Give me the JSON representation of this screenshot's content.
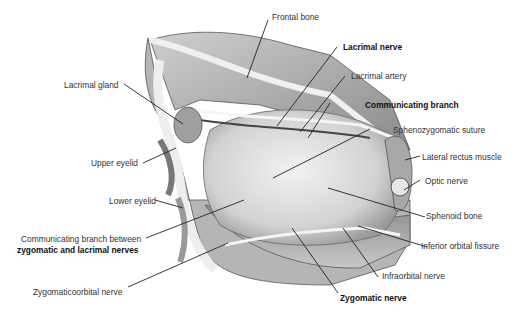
{
  "figure": {
    "type": "anatomical illustration",
    "labels": [
      {
        "id": "frontal-bone",
        "text": "Frontal bone",
        "bold": false
      },
      {
        "id": "lacrimal-nerve",
        "text": "Lacrimal nerve",
        "bold": true
      },
      {
        "id": "lacrimal-artery",
        "text": "Lacrimal artery",
        "bold": false
      },
      {
        "id": "communicating-branch",
        "text": "Communicating branch",
        "bold": true
      },
      {
        "id": "sphenozygomatic-suture",
        "text": "Sphenozygomatic suture",
        "bold": false
      },
      {
        "id": "lateral-rectus-muscle",
        "text": "Lateral rectus muscle",
        "bold": false
      },
      {
        "id": "optic-nerve",
        "text": "Optic nerve",
        "bold": false
      },
      {
        "id": "sphenoid-bone",
        "text": "Sphenoid bone",
        "bold": false
      },
      {
        "id": "inferior-orbital-fissure",
        "text": "Inferior orbital fissure",
        "bold": false
      },
      {
        "id": "infraorbital-nerve",
        "text": "Infraorbital nerve",
        "bold": false
      },
      {
        "id": "zygomatic-nerve",
        "text": "Zygomatic nerve",
        "bold": true
      },
      {
        "id": "zygomaticoorbital-nerve",
        "text": "Zygomaticoorbital nerve",
        "bold": false
      },
      {
        "id": "comm-branch-between-line1",
        "text": "Communicating branch between",
        "bold": false
      },
      {
        "id": "comm-branch-between-line2",
        "text": "zygomatic and lacrimal nerves",
        "bold": true
      },
      {
        "id": "lower-eyelid",
        "text": "Lower eyelid",
        "bold": false
      },
      {
        "id": "upper-eyelid",
        "text": "Upper eyelid",
        "bold": false
      },
      {
        "id": "lacrimal-gland",
        "text": "Lacrimal gland",
        "bold": false
      }
    ]
  }
}
